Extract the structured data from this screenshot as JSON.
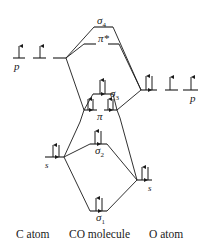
{
  "diagram": {
    "columns": {
      "left": "C atom",
      "center": "CO molecule",
      "right": "O atom"
    },
    "atomic_orbitals": {
      "c_p": {
        "label": "p",
        "electrons": [
          1,
          1,
          0
        ]
      },
      "c_s": {
        "label": "s",
        "electrons": [
          2
        ]
      },
      "o_p": {
        "label": "p",
        "electrons": [
          2,
          1,
          1
        ]
      },
      "o_s": {
        "label": "s",
        "electrons": [
          2
        ]
      }
    },
    "molecular_orbitals": {
      "sigma4": {
        "symbol": "σ",
        "sub": "4",
        "electrons": 0
      },
      "pi_star": {
        "symbol": "π*",
        "electrons": 0
      },
      "sigma3": {
        "symbol": "σ",
        "sub": "3",
        "electrons": 2
      },
      "pi": {
        "symbol": "π",
        "electrons": 4
      },
      "sigma2": {
        "symbol": "σ",
        "sub": "2",
        "electrons": 2
      },
      "sigma1": {
        "symbol": "σ",
        "sub": "1",
        "electrons": 2
      }
    },
    "colors": {
      "ink": "#1a1a1a",
      "background": "#ffffff"
    }
  }
}
